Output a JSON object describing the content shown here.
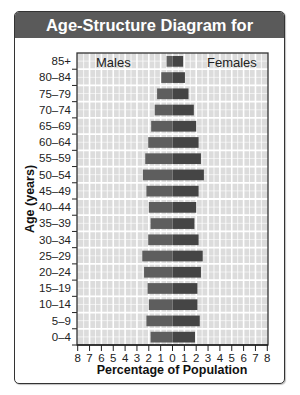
{
  "chart_data": {
    "type": "bar",
    "orientation": "horizontal-population-pyramid",
    "title": "Age-Structure Diagram for Sweden",
    "xlabel": "Percentage of Population",
    "ylabel": "Age (years)",
    "xlim": [
      -8,
      8
    ],
    "x_ticks": [
      -8,
      -7,
      -6,
      -5,
      -4,
      -3,
      -2,
      -1,
      0,
      1,
      2,
      3,
      4,
      5,
      6,
      7,
      8
    ],
    "x_tick_labels": [
      "8",
      "7",
      "6",
      "5",
      "4",
      "3",
      "2",
      "1",
      "0",
      "1",
      "2",
      "3",
      "4",
      "5",
      "6",
      "7",
      "8"
    ],
    "grid": true,
    "categories": [
      "85+",
      "80–84",
      "75–79",
      "70–74",
      "65–69",
      "60–64",
      "55–59",
      "50–54",
      "45–49",
      "40–44",
      "35–39",
      "30–34",
      "25–29",
      "20–24",
      "15–19",
      "10–14",
      "5–9",
      "0–4"
    ],
    "series": [
      {
        "name": "Males",
        "side": "left",
        "color": "#5e5e5e",
        "values": [
          0.5,
          0.95,
          1.3,
          1.5,
          1.8,
          2.05,
          2.3,
          2.5,
          2.2,
          2.0,
          1.85,
          2.05,
          2.55,
          2.4,
          2.1,
          2.0,
          2.2,
          1.85
        ]
      },
      {
        "name": "Females",
        "side": "right",
        "color": "#454545",
        "values": [
          0.9,
          1.05,
          1.35,
          1.8,
          2.0,
          2.2,
          2.4,
          2.65,
          2.2,
          2.0,
          1.85,
          2.2,
          2.55,
          2.4,
          2.1,
          2.1,
          2.3,
          1.9
        ]
      }
    ],
    "legend": {
      "males_label": "Males",
      "males_position": "top-left",
      "females_label": "Females",
      "females_position": "top-right"
    }
  },
  "colors": {
    "title_bar": "#5a5a5a",
    "plot_background": "#dcdcdc",
    "grid": "#ffffff"
  }
}
